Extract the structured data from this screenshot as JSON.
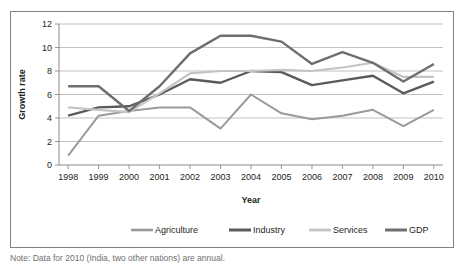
{
  "chart_data": {
    "type": "line",
    "title": "",
    "xlabel": "Year",
    "ylabel": "Growth rate",
    "categories": [
      "1998",
      "1999",
      "2000",
      "2001",
      "2002",
      "2003",
      "2004",
      "2005",
      "2006",
      "2007",
      "2008",
      "2009",
      "2010"
    ],
    "x": [
      1998,
      1999,
      2000,
      2001,
      2002,
      2003,
      2004,
      2005,
      2006,
      2007,
      2008,
      2009,
      2010
    ],
    "ylim": [
      0,
      12
    ],
    "yticks": [
      0,
      2,
      4,
      6,
      8,
      10,
      12
    ],
    "ytick_labels": [
      "0",
      "2",
      "4",
      "6",
      "8",
      "10",
      "12"
    ],
    "grid": true,
    "legend_position": "bottom",
    "series": [
      {
        "name": "Agriculture",
        "color": "#9a9a9a",
        "width": 2.0,
        "values": [
          0.8,
          4.2,
          4.6,
          4.9,
          4.9,
          3.1,
          6.0,
          4.4,
          3.9,
          4.2,
          4.7,
          3.3,
          4.7
        ]
      },
      {
        "name": "Industry",
        "color": "#5a5a5a",
        "width": 2.4,
        "values": [
          4.2,
          4.9,
          5.0,
          6.0,
          7.3,
          7.0,
          8.0,
          7.9,
          6.8,
          7.2,
          7.6,
          6.1,
          7.1
        ]
      },
      {
        "name": "Services",
        "color": "#c4c4c4",
        "width": 2.2,
        "values": [
          4.9,
          4.7,
          4.5,
          6.1,
          7.8,
          8.0,
          8.0,
          8.1,
          8.0,
          8.3,
          8.7,
          7.5,
          7.5
        ]
      },
      {
        "name": "GDP",
        "color": "#6e6e6e",
        "width": 2.4,
        "values": [
          6.7,
          6.7,
          4.6,
          6.7,
          9.5,
          11.0,
          11.0,
          10.5,
          8.6,
          9.6,
          8.7,
          7.1,
          8.6
        ]
      }
    ]
  },
  "legend": {
    "items": [
      {
        "label": "Agriculture"
      },
      {
        "label": "Industry"
      },
      {
        "label": "Services"
      },
      {
        "label": "GDP"
      }
    ]
  },
  "caption": {
    "text": "Note: Data for 2010 (India, two other nations) are annual."
  }
}
